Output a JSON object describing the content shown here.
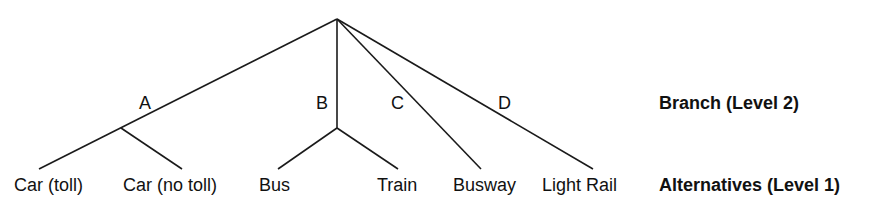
{
  "diagram": {
    "type": "nested-logit-tree",
    "root": {
      "x": 337,
      "y": 19
    },
    "branches": [
      {
        "id": "A",
        "label": "A",
        "alternatives": [
          "Car (toll)",
          "Car (no toll)"
        ]
      },
      {
        "id": "B",
        "label": "B",
        "alternatives": [
          "Bus",
          "Train"
        ]
      },
      {
        "id": "C",
        "label": "C",
        "alternatives": [
          "Busway"
        ]
      },
      {
        "id": "D",
        "label": "D",
        "alternatives": [
          "Light Rail"
        ]
      }
    ],
    "alternatives": {
      "car_toll": "Car (toll)",
      "car_no_toll": "Car (no toll)",
      "bus": "Bus",
      "train": "Train",
      "busway": "Busway",
      "light_rail": "Light Rail"
    },
    "labels": {
      "branch_a": "A",
      "branch_b": "B",
      "branch_c": "C",
      "branch_d": "D"
    },
    "legend": {
      "level2": "Branch (Level 2)",
      "level1": "Alternatives (Level 1)"
    },
    "line_color": "#1a1a1a"
  }
}
